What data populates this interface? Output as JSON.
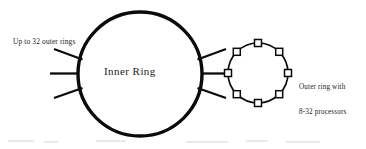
{
  "figure": {
    "type": "diagram",
    "background_color": "#ffffff",
    "ink_color": "#000000",
    "inner_ring": {
      "label": "Inner Ring",
      "shape": "circle",
      "center_x": 140,
      "center_y": 74,
      "radius": 62,
      "stroke_width": 3.4
    },
    "left_label": "Up to 32 outer rings",
    "right_label_line1": "Outer ring with",
    "right_label_line2": "8-32 processors",
    "left_spokes": {
      "count": 3,
      "description": "lines radiating from left side of inner ring"
    },
    "right_spokes": {
      "count": 3,
      "description": "lines radiating from right side of inner ring"
    },
    "outer_ring": {
      "shape": "ring-of-nodes",
      "center_x": 258,
      "center_y": 73,
      "radius": 30,
      "node_count": 8,
      "node_shape": "square",
      "node_size": 7,
      "stroke_width": 1.6,
      "node_angles_deg": [
        180,
        225,
        270,
        315,
        0,
        45,
        90,
        135
      ]
    },
    "connector": {
      "from": "inner-ring-right-edge",
      "to": "outer-ring-left-node",
      "x1": 202,
      "x2": 228,
      "y": 73
    }
  }
}
